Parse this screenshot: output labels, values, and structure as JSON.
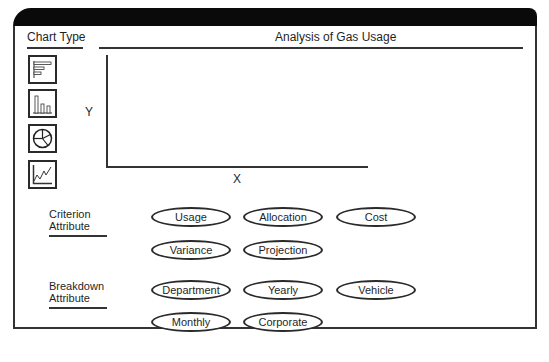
{
  "window": {
    "title": "Analysis of Gas Usage"
  },
  "chart_type": {
    "label": "Chart Type",
    "options": [
      {
        "name": "horizontal-bar-chart",
        "icon": "horizontal-bar-chart-icon"
      },
      {
        "name": "vertical-bar-chart",
        "icon": "vertical-bar-chart-icon"
      },
      {
        "name": "pie-chart",
        "icon": "pie-chart-icon"
      },
      {
        "name": "line-chart",
        "icon": "line-chart-icon"
      }
    ]
  },
  "chart_area": {
    "y_label": "Y",
    "x_label": "X"
  },
  "criterion": {
    "label_line1": "Criterion",
    "label_line2": "Attribute",
    "options": [
      "Usage",
      "Allocation",
      "Cost",
      "Variance",
      "Projection"
    ]
  },
  "breakdown": {
    "label_line1": "Breakdown",
    "label_line2": "Attribute",
    "options": [
      "Department",
      "Yearly",
      "Vehicle",
      "Monthly",
      "Corporate"
    ]
  }
}
